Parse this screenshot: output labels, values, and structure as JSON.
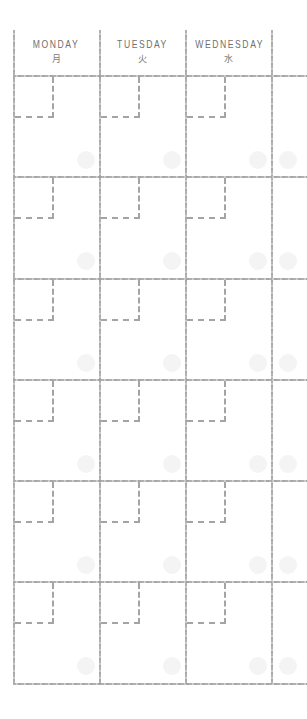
{
  "calendar": {
    "days": [
      {
        "en": "MONDAY",
        "jp": "月"
      },
      {
        "en": "TUESDAY",
        "jp": "火"
      },
      {
        "en": "WEDNESDAY",
        "jp": "水"
      },
      {
        "en": "",
        "jp": ""
      }
    ],
    "rows": 6,
    "colors": {
      "line": "#a6a6a6",
      "text": "#6f6f6f",
      "dot": "#f4f4f4",
      "background": "#ffffff"
    }
  }
}
